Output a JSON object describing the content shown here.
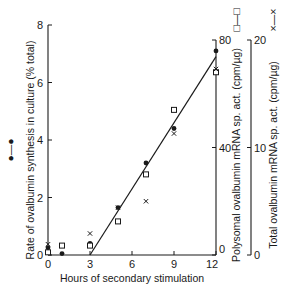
{
  "chart_data": {
    "type": "scatter",
    "title": "",
    "xlabel": "Hours of secondary stimulation",
    "ylabel": "Rate of ovalbumin synthesis in culture (% total)",
    "ylabel_legend": "●—●",
    "y2label": "Polysomal ovalbumin mRNA sp. act. (cpm/µg)",
    "y2label_legend": "□—□",
    "y3label": "Total ovalbumin mRNA sp. act. (cpm/µg)",
    "y3label_legend": "×—×",
    "xlim": [
      0,
      12
    ],
    "ylim": [
      0,
      8
    ],
    "y2lim": [
      0,
      80
    ],
    "y3lim": [
      0,
      20
    ],
    "x_ticks": [
      "0",
      "3",
      "6",
      "9",
      "12"
    ],
    "y_ticks": [
      "0",
      "2",
      "4",
      "6",
      "8"
    ],
    "y2_ticks": [
      "0",
      "40",
      "80"
    ],
    "y3_ticks": [
      "0",
      "10",
      "20"
    ],
    "grid": false,
    "series": [
      {
        "name": "Rate of ovalbumin synthesis (% total)",
        "marker": "filled-circle",
        "axis": "left",
        "x": [
          0,
          1,
          3,
          5,
          7,
          9,
          12
        ],
        "values": [
          0.25,
          0.05,
          0.4,
          1.65,
          3.2,
          4.4,
          7.1
        ]
      },
      {
        "name": "Polysomal ovalbumin mRNA sp. act. (cpm/µg)",
        "marker": "open-square",
        "axis": "right-inner",
        "x": [
          0,
          1,
          3,
          5,
          7,
          9,
          12
        ],
        "values": [
          1,
          3.5,
          3.5,
          12.5,
          30,
          54,
          68
        ]
      },
      {
        "name": "Total ovalbumin mRNA sp. act. (cpm/µg)",
        "marker": "cross",
        "axis": "right-outer",
        "x": [
          0,
          3,
          5,
          7,
          9,
          12
        ],
        "values": [
          1,
          2,
          4.4,
          5,
          11.3,
          17.3
        ]
      }
    ],
    "fit_line": {
      "x": [
        3,
        12
      ],
      "y": [
        0,
        6.9
      ]
    }
  }
}
